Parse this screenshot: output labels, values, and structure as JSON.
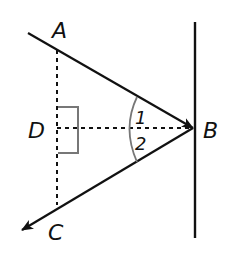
{
  "diagram": {
    "type": "geometry-reflection",
    "points": {
      "A": {
        "label": "A"
      },
      "B": {
        "label": "B"
      },
      "C": {
        "label": "C"
      },
      "D": {
        "label": "D"
      }
    },
    "angles": {
      "angle1": {
        "label": "1"
      },
      "angle2": {
        "label": "2"
      }
    },
    "elements": [
      "mirror line (vertical, solid) through B",
      "incident ray toward B (arrow at B) passing through A",
      "reflected ray from B (arrow at end) passing through C",
      "dashed segment AC (vertical) through D",
      "dashed segment DB (horizontal, normal at B)",
      "right-angle marker at D",
      "angle arc at B split into angle 1 and angle 2"
    ],
    "colors": {
      "line": "#111111",
      "marker": "#777777",
      "background": "#ffffff"
    }
  }
}
